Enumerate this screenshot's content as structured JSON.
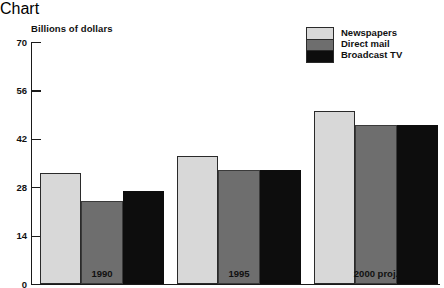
{
  "chart_data": {
    "type": "bar",
    "title": "",
    "xlabel": "",
    "ylabel": "Billions of dollars",
    "categories": [
      "1990",
      "1995",
      "2000 proj."
    ],
    "series": [
      {
        "name": "Newspapers",
        "values": [
          32,
          37,
          50
        ],
        "color": "#d8d8d8"
      },
      {
        "name": "Direct mail",
        "values": [
          24,
          33,
          46
        ],
        "color": "#6e6e6e"
      },
      {
        "name": "Broadcast TV",
        "values": [
          27,
          33,
          46
        ],
        "color": "#0d0d0d"
      }
    ],
    "ylim": [
      0,
      70
    ],
    "yticks": [
      0,
      14,
      28,
      42,
      56,
      70
    ],
    "ytick_labels": [
      "0",
      "14",
      "28",
      "42",
      "56",
      "70"
    ],
    "grid": false,
    "legend_position": "top-right"
  }
}
